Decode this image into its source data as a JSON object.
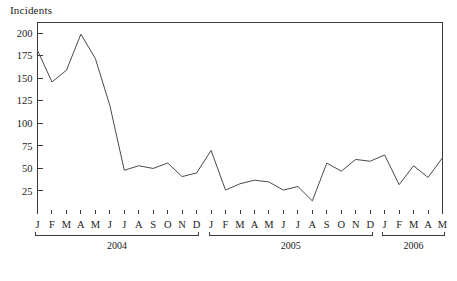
{
  "chart_data": {
    "type": "line",
    "title": "",
    "ylabel": "Incidents",
    "xlabel": "",
    "ylim": [
      0,
      212
    ],
    "yticks": [
      25,
      50,
      75,
      100,
      125,
      150,
      175,
      200
    ],
    "grid": false,
    "legend": "none",
    "categories": [
      "J",
      "F",
      "M",
      "A",
      "M",
      "J",
      "J",
      "A",
      "S",
      "O",
      "N",
      "D",
      "J",
      "F",
      "M",
      "A",
      "M",
      "J",
      "J",
      "A",
      "S",
      "O",
      "N",
      "D",
      "J",
      "F",
      "M",
      "A",
      "M"
    ],
    "x_full_labels": [
      "Jan 2004",
      "Feb 2004",
      "Mar 2004",
      "Apr 2004",
      "May 2004",
      "Jun 2004",
      "Jul 2004",
      "Aug 2004",
      "Sep 2004",
      "Oct 2004",
      "Nov 2004",
      "Dec 2004",
      "Jan 2005",
      "Feb 2005",
      "Mar 2005",
      "Apr 2005",
      "May 2005",
      "Jun 2005",
      "Jul 2005",
      "Aug 2005",
      "Sep 2005",
      "Oct 2005",
      "Nov 2005",
      "Dec 2005",
      "Jan 2006",
      "Feb 2006",
      "Mar 2006",
      "Apr 2006",
      "May 2006"
    ],
    "values": [
      181,
      146,
      159,
      199,
      172,
      120,
      48,
      53,
      50,
      56,
      41,
      45,
      70,
      26,
      33,
      37,
      35,
      26,
      30,
      14,
      56,
      47,
      60,
      58,
      65,
      32,
      53,
      40,
      62
    ],
    "year_groups": [
      {
        "label": "2004",
        "start_index": 0,
        "end_index": 11
      },
      {
        "label": "2005",
        "start_index": 12,
        "end_index": 23
      },
      {
        "label": "2006",
        "start_index": 24,
        "end_index": 28
      }
    ],
    "line_color": "#4a4a4a",
    "axis_color": "#3a3a3a",
    "background_color": "#ffffff"
  }
}
